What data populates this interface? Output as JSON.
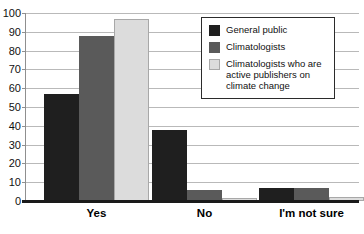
{
  "chart_data": {
    "type": "bar",
    "title": "",
    "subtitle": "",
    "xlabel": "",
    "ylabel": "",
    "ylim": [
      0,
      100
    ],
    "ytick_labels": [
      "100",
      "90",
      "80",
      "70",
      "60",
      "50",
      "40",
      "30",
      "20",
      "10",
      "0"
    ],
    "yticks": [
      100,
      90,
      80,
      70,
      60,
      50,
      40,
      30,
      20,
      10,
      0
    ],
    "grid": true,
    "legend_position": "upper right",
    "categories": [
      "Yes",
      "No",
      "I'm not sure"
    ],
    "series": [
      {
        "name": "General public",
        "color": "#1f1f1f",
        "values": [
          57,
          38,
          7
        ]
      },
      {
        "name": "Climatologists",
        "color": "#5a5a5a",
        "values": [
          88,
          6,
          7
        ]
      },
      {
        "name": "Climatologists who are active publishers on climate change",
        "color": "#dcdcdc",
        "values": [
          97,
          1.5,
          2
        ]
      }
    ]
  },
  "legend": {
    "items": [
      {
        "label": "General public"
      },
      {
        "label": "Climatologists"
      },
      {
        "label": "Climatologists who are active publishers on climate change"
      }
    ]
  }
}
